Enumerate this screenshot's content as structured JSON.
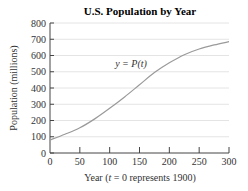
{
  "chart_data": {
    "type": "line",
    "title": "U.S. Population by Year",
    "xlabel": "Year (t = 0 represents 1900)",
    "xlabel_parts": [
      "Year (",
      "t",
      " = 0 represents 1900)"
    ],
    "ylabel": "Population (millions)",
    "xlim": [
      0,
      300
    ],
    "ylim": [
      0,
      800
    ],
    "xticks": [
      0,
      50,
      100,
      150,
      200,
      250,
      300
    ],
    "yticks": [
      0,
      100,
      200,
      300,
      400,
      500,
      600,
      700,
      800
    ],
    "grid": "horizontal",
    "legend": "none",
    "annotations": [
      {
        "text": "y = P(t)",
        "x": 130,
        "y": 560
      }
    ],
    "series": [
      {
        "name": "y = P(t)",
        "x": [
          0,
          25,
          50,
          75,
          100,
          125,
          150,
          175,
          200,
          225,
          250,
          275,
          300
        ],
        "values": [
          80,
          115,
          155,
          210,
          275,
          345,
          420,
          495,
          555,
          605,
          640,
          665,
          685
        ]
      }
    ]
  },
  "colors": {
    "curve": "#9a9a9a",
    "grid": "#e4e4e4",
    "axis": "#444444"
  }
}
